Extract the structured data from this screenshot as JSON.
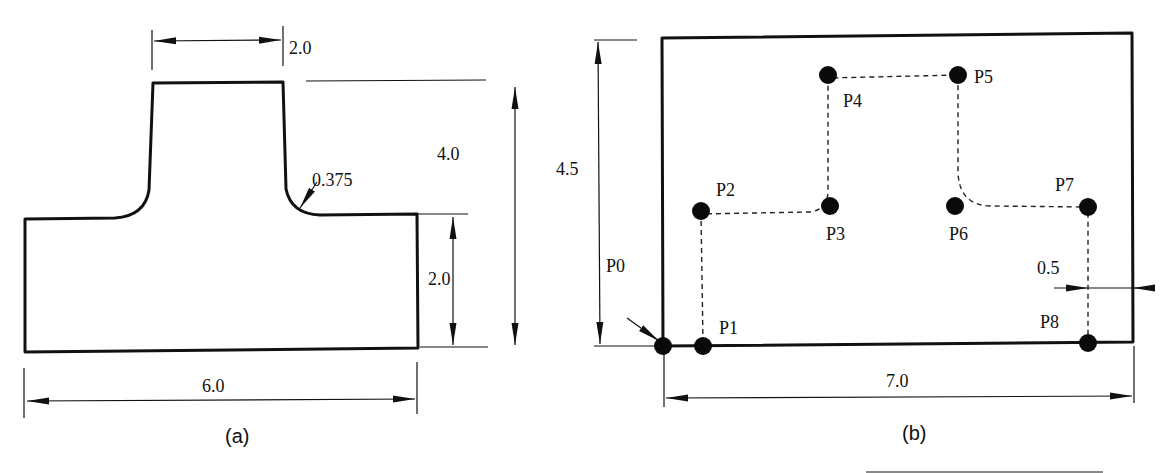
{
  "figure_a": {
    "caption": "(a)",
    "dimensions": {
      "top_width": "2.0",
      "total_height": "4.0",
      "fillet_radius": "0.375",
      "base_height": "2.0",
      "base_width": "6.0"
    }
  },
  "figure_b": {
    "caption": "(b)",
    "dimensions": {
      "height": "4.5",
      "width": "7.0",
      "offset": "0.5"
    },
    "points": [
      {
        "label": "P0",
        "x": 663,
        "y": 346
      },
      {
        "label": "P1",
        "x": 703,
        "y": 346
      },
      {
        "label": "P2",
        "x": 701,
        "y": 211
      },
      {
        "label": "P3",
        "x": 830,
        "y": 206
      },
      {
        "label": "P4",
        "x": 828,
        "y": 75
      },
      {
        "label": "P5",
        "x": 958,
        "y": 75
      },
      {
        "label": "P6",
        "x": 955,
        "y": 206
      },
      {
        "label": "P7",
        "x": 1088,
        "y": 207
      },
      {
        "label": "P8",
        "x": 1088,
        "y": 343
      }
    ]
  }
}
